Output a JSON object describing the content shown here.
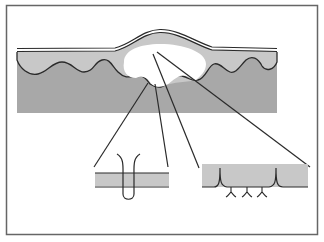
{
  "diagram": {
    "labels": [],
    "colors": {
      "background": "#ffffff",
      "frame": "#666666",
      "epidermis": "#c8c8c8",
      "dermis": "#a8a8a8",
      "blister_cavity": "#ffffff",
      "outline": "#2a2a2a",
      "inset_band": "#c8c8c8"
    },
    "parts": {
      "frame": "outer border",
      "skin_block": "skin layers",
      "blister": "blister cavity",
      "callout_lines": 4,
      "inset_left": "detail: structure crossing membrane",
      "inset_right": "detail: basement layer with anchoring structures"
    }
  }
}
